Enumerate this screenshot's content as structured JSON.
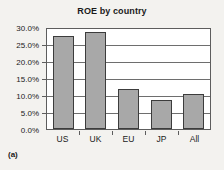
{
  "chart_data": {
    "type": "bar",
    "title": "ROE by country",
    "categories": [
      "US",
      "UK",
      "EU",
      "JP",
      "All"
    ],
    "values": [
      27.8,
      29.0,
      12.0,
      8.7,
      10.5
    ],
    "xlabel": "",
    "ylabel": "",
    "ylim": [
      0,
      30
    ],
    "ytick_values": [
      0,
      5,
      10,
      15,
      20,
      25,
      30
    ],
    "ytick_labels": [
      "0.0%",
      "5.0%",
      "10.0%",
      "15.0%",
      "20.0%",
      "25.0%",
      "30.0%"
    ],
    "grid": true,
    "legend": false,
    "bar_color": "#a8a8a8",
    "bar_border_color": "#3c3c3c",
    "plot_background": "#ffffff",
    "figure_background": "#f3f2ef",
    "axis_color": "#5d5d5d"
  },
  "caption": "(a)"
}
